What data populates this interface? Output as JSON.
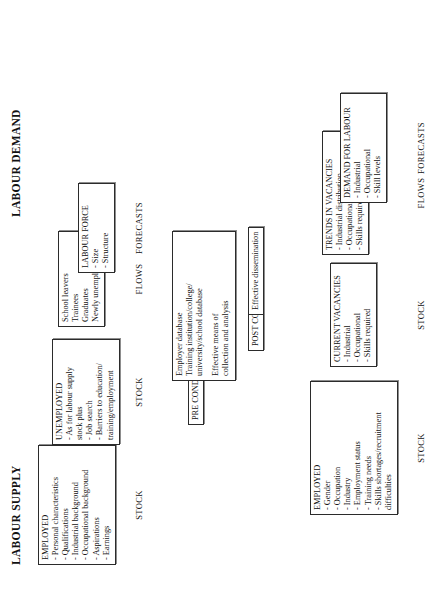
{
  "diagram": {
    "title_supply": "LABOUR SUPPLY",
    "title_demand": "LABOUR DEMAND"
  },
  "supply": {
    "employed": {
      "title": "EMPLOYED",
      "items": [
        "- Personal characteristics",
        "- Qualifications",
        "- Industrial background",
        "- Occupational background",
        "- Aspirations",
        "- Earnings"
      ],
      "label": "STOCK"
    },
    "unemployed": {
      "title": "UNEMPLOYED",
      "items": [
        "- As for labour supply",
        "stock plus",
        "- Job search",
        "- Barriers to education/",
        "training/employment"
      ],
      "label": "STOCK"
    },
    "flows": {
      "items": [
        "School leavers",
        "Trainees",
        "Graduates",
        "Newly unemployed"
      ],
      "label": "FLOWS"
    },
    "forecasts": {
      "title": "LABOUR FORCE",
      "items": [
        "- Size",
        "- Structure"
      ],
      "label": "FORECASTS"
    }
  },
  "conditions": {
    "pre_label": "PRE CONDITIONS",
    "pre_box": {
      "lines_a": [
        "Employer database",
        "Training institution/college/",
        "university/school database"
      ],
      "lines_b": [
        "Effective means of",
        "collection and analysis"
      ]
    },
    "post_label": "POST CONDITION",
    "post_box": "Effective dissemination"
  },
  "demand": {
    "employed": {
      "title": "EMPLOYED",
      "items": [
        "- Gender",
        "- Occupation",
        "- Industry",
        "- Employment status",
        "- Training needs",
        "- Skills shortages/recruitment",
        "difficulties"
      ],
      "label": "STOCK"
    },
    "vacancies": {
      "title": "CURRENT VACANCIES",
      "items": [
        "- Industrial",
        "- Occupational",
        "- Skills required"
      ],
      "label": "STOCK"
    },
    "trends": {
      "title": "TRENDS IN VACANCIES",
      "items": [
        "- Industrial distribution",
        "- Occupational distribution",
        "- Skills required"
      ],
      "label": "FLOWS"
    },
    "forecasts": {
      "title": "DEMAND FOR LABOUR",
      "items": [
        "- Industrial",
        "- Occupational",
        "- Skill levels"
      ],
      "label": "FORECASTS"
    }
  }
}
